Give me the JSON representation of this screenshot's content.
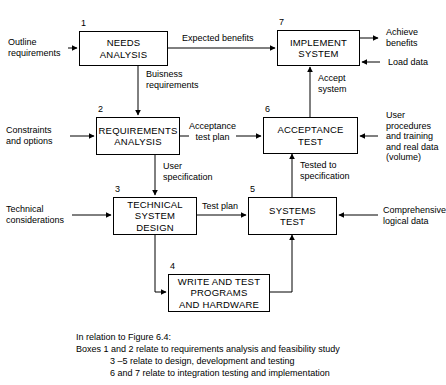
{
  "diagram": {
    "boxes": [
      {
        "number": "1",
        "lines": [
          "NEEDS",
          "ANALYSIS"
        ],
        "name": "needs-analysis"
      },
      {
        "number": "2",
        "lines": [
          "REQUIREMENTS",
          "ANALYSIS"
        ],
        "name": "requirements-analysis"
      },
      {
        "number": "3",
        "lines": [
          "TECHNICAL",
          "SYSTEM",
          "DESIGN"
        ],
        "name": "technical-system-design"
      },
      {
        "number": "4",
        "lines": [
          "WRITE AND TEST",
          "PROGRAMS",
          "AND HARDWARE"
        ],
        "name": "write-and-test-programs"
      },
      {
        "number": "5",
        "lines": [
          "SYSTEMS",
          "TEST"
        ],
        "name": "systems-test"
      },
      {
        "number": "6",
        "lines": [
          "ACCEPTANCE",
          "TEST"
        ],
        "name": "acceptance-test"
      },
      {
        "number": "7",
        "lines": [
          "IMPLEMENT",
          "SYSTEM"
        ],
        "name": "implement-system"
      }
    ],
    "flow_labels": {
      "outline_requirements": "Outline\nrequirements",
      "expected_benefits": "Expected benefits",
      "achieve_benefits": "Achieve\nbenefits",
      "load_data": "Load data",
      "business_requirements": "Buisness\nrequirements",
      "accept_system": "Accept\nsystem",
      "constraints_and_options": "Constraints\nand options",
      "acceptance_test_plan": "Acceptance\ntest plan",
      "user_procedures": "User\nprocedures\nand training\nand real data\n(volume)",
      "user_specification": "User\nspecification",
      "tested_to_specification": "Tested to\nspecification",
      "technical_considerations": "Technical\nconsiderations",
      "test_plan": "Test plan",
      "comprehensive_logical_data": "Comprehensive\nlogical data"
    },
    "caption": {
      "line1": "In relation to Figure 6.4:",
      "line2": "Boxes 1 and 2 relate to requirements analysis and feasibility study",
      "line3": "3 –5 relate to design, development and testing",
      "line4": "6 and 7 relate to integration testing and implementation"
    },
    "colors": {
      "stroke": "#000000",
      "background": "#ffffff",
      "text": "#000000"
    }
  }
}
